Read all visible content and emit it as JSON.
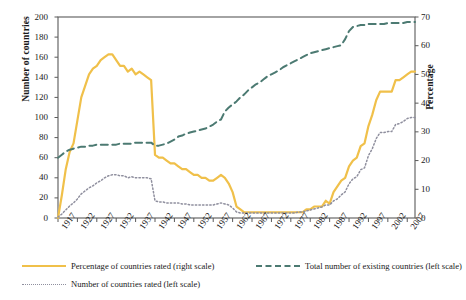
{
  "chart_data": {
    "type": "line",
    "title": "",
    "xlabel": "",
    "ylabel": "Number of countries",
    "y2label": "Percentage",
    "xlim": [
      1917,
      2009
    ],
    "ylim": [
      0,
      200
    ],
    "y2lim": [
      0,
      70
    ],
    "grid": false,
    "legend_position": "below-axes",
    "x_tick_labels": [
      "1917",
      "1922",
      "1927",
      "1932",
      "1937",
      "1942",
      "1947",
      "1952",
      "1957",
      "1962",
      "1967",
      "1972",
      "1977",
      "1982",
      "1987",
      "1992",
      "1997",
      "2002",
      "2007"
    ],
    "y_tick_labels": [
      "0",
      "20",
      "40",
      "60",
      "80",
      "100",
      "120",
      "140",
      "160",
      "180",
      "200"
    ],
    "y2_tick_labels": [
      "0",
      "10",
      "20",
      "30",
      "40",
      "50",
      "60",
      "70"
    ],
    "series": [
      {
        "name": "Percentage of countries rated (right scale)",
        "axis": "right",
        "style": "solid",
        "color": "#f0c04a",
        "x": [
          1917,
          1918,
          1919,
          1920,
          1921,
          1922,
          1923,
          1924,
          1925,
          1926,
          1927,
          1928,
          1929,
          1930,
          1931,
          1932,
          1933,
          1934,
          1935,
          1936,
          1937,
          1938,
          1939,
          1940,
          1941,
          1942,
          1943,
          1944,
          1945,
          1946,
          1947,
          1948,
          1949,
          1950,
          1951,
          1952,
          1953,
          1954,
          1955,
          1956,
          1957,
          1958,
          1959,
          1960,
          1961,
          1962,
          1963,
          1964,
          1965,
          1966,
          1967,
          1968,
          1969,
          1970,
          1971,
          1972,
          1973,
          1974,
          1975,
          1976,
          1977,
          1978,
          1979,
          1980,
          1981,
          1982,
          1983,
          1984,
          1985,
          1986,
          1987,
          1988,
          1989,
          1990,
          1991,
          1992,
          1993,
          1994,
          1995,
          1996,
          1997,
          1998,
          1999,
          2000,
          2001,
          2002,
          2003,
          2004,
          2005,
          2006,
          2007,
          2008,
          2009
        ],
        "y": [
          0,
          8,
          17,
          23,
          26,
          34,
          42,
          46,
          50,
          52,
          53,
          55,
          56,
          57,
          57,
          55,
          53,
          53,
          51,
          52,
          50,
          51,
          50,
          49,
          48,
          22,
          21,
          21,
          20,
          19,
          19,
          18,
          17,
          17,
          16,
          15,
          15,
          14,
          14,
          13,
          13,
          14,
          15,
          14,
          12,
          9,
          4,
          3,
          2,
          2,
          2,
          2,
          2,
          2,
          2,
          2,
          2,
          2,
          2,
          2,
          2,
          2,
          2,
          2,
          3,
          3,
          4,
          4,
          4,
          6,
          5,
          9,
          11,
          13,
          14,
          18,
          20,
          21,
          25,
          26,
          32,
          36,
          41,
          44,
          44,
          44,
          44,
          48,
          48,
          49,
          50,
          51,
          51
        ]
      },
      {
        "name": "Total number of existing countries (left scale)",
        "axis": "left",
        "style": "dashed",
        "color": "#4c7a72",
        "x": [
          1917,
          1918,
          1919,
          1920,
          1921,
          1922,
          1923,
          1924,
          1925,
          1926,
          1927,
          1928,
          1929,
          1930,
          1931,
          1932,
          1933,
          1934,
          1935,
          1936,
          1937,
          1938,
          1939,
          1940,
          1941,
          1942,
          1943,
          1944,
          1945,
          1946,
          1947,
          1948,
          1949,
          1950,
          1951,
          1952,
          1953,
          1954,
          1955,
          1956,
          1957,
          1958,
          1959,
          1960,
          1961,
          1962,
          1963,
          1964,
          1965,
          1966,
          1967,
          1968,
          1969,
          1970,
          1971,
          1972,
          1973,
          1974,
          1975,
          1976,
          1977,
          1978,
          1979,
          1980,
          1981,
          1982,
          1983,
          1984,
          1985,
          1986,
          1987,
          1988,
          1989,
          1990,
          1991,
          1992,
          1993,
          1994,
          1995,
          1996,
          1997,
          1998,
          1999,
          2000,
          2001,
          2002,
          2003,
          2004,
          2005,
          2006,
          2007,
          2008,
          2009
        ],
        "y": [
          60,
          63,
          66,
          68,
          69,
          70,
          71,
          71,
          72,
          72,
          73,
          73,
          73,
          73,
          73,
          73,
          74,
          74,
          74,
          74,
          75,
          75,
          75,
          75,
          75,
          72,
          72,
          73,
          74,
          76,
          78,
          81,
          82,
          84,
          85,
          86,
          87,
          88,
          89,
          91,
          93,
          96,
          98,
          106,
          110,
          113,
          116,
          120,
          123,
          127,
          130,
          133,
          135,
          138,
          141,
          143,
          145,
          147,
          150,
          152,
          154,
          156,
          158,
          160,
          162,
          164,
          165,
          166,
          167,
          168,
          169,
          170,
          171,
          172,
          178,
          186,
          190,
          191,
          192,
          192,
          193,
          193,
          193,
          193,
          193,
          194,
          194,
          194,
          194,
          194,
          195,
          195,
          195
        ]
      },
      {
        "name": "Number of countries rated (left scale)",
        "axis": "left",
        "style": "dotted",
        "color": "#8f8f9e",
        "x": [
          1917,
          1918,
          1919,
          1920,
          1921,
          1922,
          1923,
          1924,
          1925,
          1926,
          1927,
          1928,
          1929,
          1930,
          1931,
          1932,
          1933,
          1934,
          1935,
          1936,
          1937,
          1938,
          1939,
          1940,
          1941,
          1942,
          1943,
          1944,
          1945,
          1946,
          1947,
          1948,
          1949,
          1950,
          1951,
          1952,
          1953,
          1954,
          1955,
          1956,
          1957,
          1958,
          1959,
          1960,
          1961,
          1962,
          1963,
          1964,
          1965,
          1966,
          1967,
          1968,
          1969,
          1970,
          1971,
          1972,
          1973,
          1974,
          1975,
          1976,
          1977,
          1978,
          1979,
          1980,
          1981,
          1982,
          1983,
          1984,
          1985,
          1986,
          1987,
          1988,
          1989,
          1990,
          1991,
          1992,
          1993,
          1994,
          1995,
          1996,
          1997,
          1998,
          1999,
          2000,
          2001,
          2002,
          2003,
          2004,
          2005,
          2006,
          2007,
          2008,
          2009
        ],
        "y": [
          1,
          4,
          8,
          12,
          15,
          19,
          24,
          27,
          30,
          32,
          35,
          37,
          40,
          42,
          43,
          43,
          42,
          42,
          40,
          41,
          40,
          40,
          40,
          40,
          39,
          17,
          16,
          16,
          15,
          15,
          15,
          15,
          14,
          14,
          13,
          13,
          13,
          13,
          13,
          13,
          13,
          14,
          15,
          14,
          13,
          10,
          6,
          5,
          5,
          5,
          5,
          5,
          5,
          5,
          5,
          5,
          5,
          5,
          5,
          5,
          5,
          5,
          6,
          6,
          7,
          8,
          9,
          10,
          11,
          13,
          13,
          17,
          19,
          23,
          26,
          34,
          39,
          41,
          48,
          50,
          62,
          69,
          79,
          85,
          85,
          86,
          86,
          93,
          94,
          96,
          99,
          100,
          100
        ]
      }
    ]
  },
  "axes": {
    "left_title": "Number of countries",
    "right_title": "Percentage"
  },
  "legend": {
    "items": [
      {
        "label": "Percentage of countries rated (right scale)",
        "style": "solid",
        "color": "#f0c04a"
      },
      {
        "label": "Total number of existing countries (left scale)",
        "style": "dashed",
        "color": "#4c7a72"
      },
      {
        "label": "Number of countries rated (left scale)",
        "style": "dotted",
        "color": "#8f8f9e"
      }
    ]
  }
}
